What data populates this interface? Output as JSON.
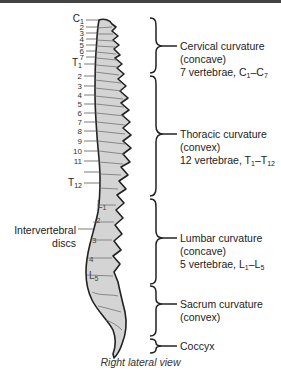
{
  "figure": {
    "caption": "Right lateral view",
    "regions": [
      {
        "name": "Cervical curvature",
        "curve": "(concave)",
        "count_text": "7 vertebrae, C",
        "range_start_sub": "1",
        "range_sep": "–C",
        "range_end_sub": "7"
      },
      {
        "name": "Thoracic curvature",
        "curve": "(convex)",
        "count_text": "12 vertebrae, T",
        "range_start_sub": "1",
        "range_sep": "–T",
        "range_end_sub": "12"
      },
      {
        "name": "Lumbar curvature",
        "curve": "(concave)",
        "count_text": "5 vertebrae, L",
        "range_start_sub": "1",
        "range_sep": "–L",
        "range_end_sub": "5"
      },
      {
        "name": "Sacrum curvature",
        "curve": "(convex)"
      },
      {
        "name": "Coccyx"
      }
    ],
    "vertebra_labels": {
      "c1_letter": "C",
      "c1_sub": "1",
      "cervical": [
        "2",
        "3",
        "4",
        "5",
        "6",
        "7"
      ],
      "t1_letter": "T",
      "t1_sub": "1",
      "thoracic": [
        "2",
        "3",
        "4",
        "5",
        "6",
        "7",
        "8",
        "9",
        "10",
        "11"
      ],
      "t12_letter": "T",
      "t12_sub": "12",
      "l1_letter": "L",
      "l1_sub": "1",
      "lumbar": [
        "2",
        "3",
        "4"
      ],
      "l5_letter": "L",
      "l5_sub": "5"
    },
    "intervertebral": {
      "line1": "Intervertebral",
      "line2": "discs"
    },
    "colors": {
      "bone_fill": "#d4d4d4",
      "outline": "#222222",
      "bracket": "#222222"
    }
  }
}
